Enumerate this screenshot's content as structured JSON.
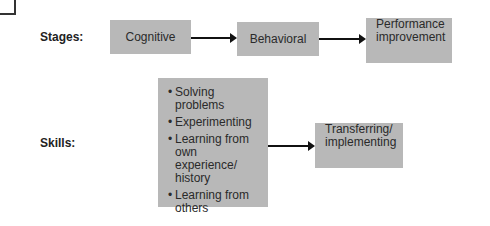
{
  "diagram": {
    "rows": {
      "stages_label": "Stages:",
      "skills_label": "Skills:"
    },
    "stages": [
      {
        "label": "Cognitive"
      },
      {
        "label": "Behavioral"
      },
      {
        "label": "Performance improvement",
        "line1": "Performance",
        "line2": "improvement"
      }
    ],
    "skills": {
      "items": [
        "Solving problems",
        "Experimenting",
        "Learning from own experience/ history",
        "Learning from others"
      ],
      "outcome": {
        "label": "Transferring/ implementing",
        "line1": "Transferring/",
        "line2": "implementing"
      }
    },
    "colors": {
      "box_fill": "#b8b8b8",
      "arrow": "#111111",
      "text": "#2a2a2a"
    }
  }
}
